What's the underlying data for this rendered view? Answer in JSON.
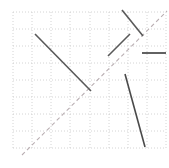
{
  "canvas": {
    "width": 169,
    "height": 168,
    "background": "#ffffff"
  },
  "chart_data": {
    "type": "scatter",
    "title": "",
    "subtitle": "",
    "xlabel": "",
    "ylabel": "",
    "grid": true,
    "legend": null,
    "tick_labels": {
      "x": [],
      "y": []
    },
    "axis_ranges": {
      "x_pixels": [
        13,
        166
      ],
      "y_pixels": [
        12,
        148
      ]
    },
    "grid_spec": {
      "style": "dotted",
      "color": "#c9c9c9",
      "stroke_width": 0.8,
      "dash": "1 2",
      "x_lines": [
        13,
        32,
        51,
        70,
        90,
        109,
        128,
        147,
        166
      ],
      "y_lines": [
        12,
        29,
        46,
        63,
        80,
        97,
        114,
        131,
        148
      ],
      "columns": 8,
      "rows": 8
    },
    "reference_line": {
      "name": "identity-diagonal",
      "style": "dashed",
      "color": "#b9aeb2",
      "stroke_width": 1.1,
      "dash": "4 3",
      "x1": 22,
      "y1": 155,
      "x2": 167,
      "y2": 11
    },
    "segments": [
      {
        "name": "segment-upper-left-descending",
        "color": "#595959",
        "stroke_width": 1.6,
        "x1": 35,
        "y1": 34,
        "x2": 91,
        "y2": 91
      },
      {
        "name": "segment-top-right-descending",
        "color": "#595959",
        "stroke_width": 1.6,
        "x1": 122,
        "y1": 10,
        "x2": 143,
        "y2": 36
      },
      {
        "name": "segment-middle-ascending",
        "color": "#595959",
        "stroke_width": 1.6,
        "x1": 108,
        "y1": 56,
        "x2": 130,
        "y2": 34
      },
      {
        "name": "segment-right-horizontal",
        "color": "#3a3a3a",
        "stroke_width": 1.6,
        "x1": 142,
        "y1": 53,
        "x2": 166,
        "y2": 53
      },
      {
        "name": "segment-lower-right-steep",
        "color": "#4a4a4a",
        "stroke_width": 1.6,
        "x1": 125,
        "y1": 74,
        "x2": 145,
        "y2": 147
      }
    ],
    "frame": {
      "name": "plot-frame",
      "visible": false,
      "color": "#c9c9c9"
    }
  }
}
